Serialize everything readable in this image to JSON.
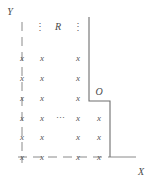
{
  "figure": {
    "type": "lattice-region-diagram",
    "axes": {
      "y_label": "Y",
      "x_label": "X",
      "y_label_pos": {
        "x": 10,
        "y": 12
      },
      "x_label_pos": {
        "x": 141,
        "y": 172
      }
    },
    "labels": {
      "region": "R",
      "region_pos": {
        "x": 58,
        "y": 27
      },
      "corner": "O",
      "corner_pos": {
        "x": 99,
        "y": 92
      }
    },
    "point_glyph": "x",
    "vertical_ellipsis": "⋮",
    "horizontal_ellipsis": "⋯",
    "vertical_ellipsis_positions": [
      {
        "x": 40,
        "y": 27
      },
      {
        "x": 78,
        "y": 27
      }
    ],
    "horizontal_ellipsis_positions": [
      {
        "x": 60,
        "y": 118
      }
    ],
    "lattice_points": [
      {
        "x": 22,
        "y": 58
      },
      {
        "x": 42,
        "y": 58
      },
      {
        "x": 78,
        "y": 58
      },
      {
        "x": 22,
        "y": 78
      },
      {
        "x": 42,
        "y": 78
      },
      {
        "x": 78,
        "y": 78
      },
      {
        "x": 22,
        "y": 98
      },
      {
        "x": 42,
        "y": 98
      },
      {
        "x": 78,
        "y": 98
      },
      {
        "x": 22,
        "y": 118
      },
      {
        "x": 42,
        "y": 118
      },
      {
        "x": 78,
        "y": 118
      },
      {
        "x": 99,
        "y": 118
      },
      {
        "x": 22,
        "y": 137
      },
      {
        "x": 42,
        "y": 137
      },
      {
        "x": 78,
        "y": 137
      },
      {
        "x": 99,
        "y": 137
      },
      {
        "x": 22,
        "y": 157
      },
      {
        "x": 42,
        "y": 157
      },
      {
        "x": 78,
        "y": 157
      },
      {
        "x": 99,
        "y": 157
      }
    ],
    "colors": {
      "line": "#8a8a8a",
      "boundary": "#6e6e6e",
      "text": "#4a4a4a",
      "mark": "#555555",
      "background": "#ffffff"
    },
    "strokes": {
      "y_axis": {
        "x1": 22,
        "y1": 22,
        "x2": 22,
        "y2": 163,
        "style": "dashed"
      },
      "x_axis": {
        "x1": 18,
        "y1": 157,
        "x2": 134,
        "y2": 157,
        "style": "dashed"
      },
      "boundary_vertical_upper": {
        "x1": 89,
        "y1": 17,
        "x2": 89,
        "y2": 101
      },
      "boundary_horizontal_step": {
        "x1": 89,
        "y1": 101,
        "x2": 110,
        "y2": 101
      },
      "boundary_vertical_lower": {
        "x1": 110,
        "y1": 101,
        "x2": 110,
        "y2": 157
      }
    }
  }
}
